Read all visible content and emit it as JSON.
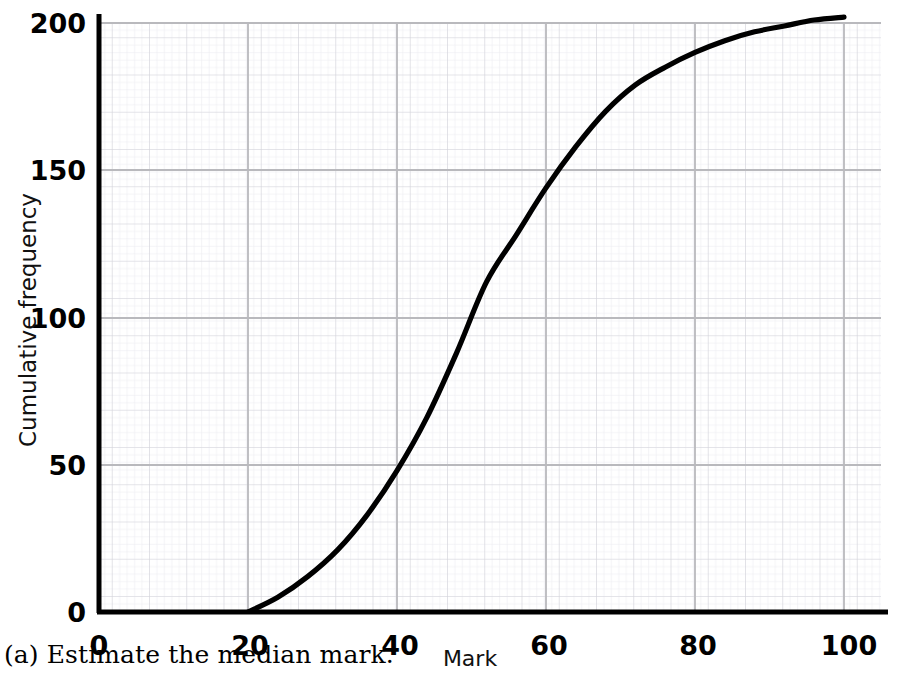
{
  "caption": "(a)  Estimate the median mark.",
  "axes": {
    "xlabel": "Mark",
    "ylabel": "Cumulative frequency",
    "xticks": [
      "0",
      "20",
      "40",
      "60",
      "80",
      "100"
    ],
    "yticks": [
      "0",
      "50",
      "100",
      "150",
      "200"
    ]
  },
  "colors": {
    "curve": "#000000",
    "axis": "#000000",
    "grid_major": "#b8b8b8",
    "grid_medium": "#d2d2d8",
    "grid_minor": "#e8e8ee",
    "background": "#ffffff",
    "text": "#111111"
  },
  "chart_data": {
    "type": "line",
    "title": "",
    "xlabel": "Mark",
    "ylabel": "Cumulative frequency",
    "xlim": [
      0,
      104
    ],
    "ylim": [
      0,
      207
    ],
    "xticks": [
      0,
      20,
      40,
      60,
      80,
      100
    ],
    "yticks": [
      0,
      50,
      100,
      150,
      200
    ],
    "grid": true,
    "legend": null,
    "series": [
      {
        "name": "Cumulative frequency",
        "x": [
          20,
          24,
          28,
          32,
          36,
          40,
          44,
          48,
          52,
          56,
          60,
          64,
          68,
          72,
          76,
          80,
          84,
          88,
          92,
          96,
          100
        ],
        "y": [
          0,
          5,
          12,
          21,
          33,
          48,
          66,
          88,
          112,
          128,
          144,
          158,
          170,
          179,
          185,
          190,
          194,
          197,
          199,
          201,
          202
        ]
      }
    ],
    "annotations": []
  }
}
